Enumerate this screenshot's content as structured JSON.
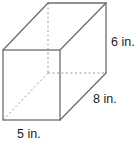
{
  "figure": {
    "type": "rectangular-prism",
    "labels": {
      "height": "6 in.",
      "depth": "8 in.",
      "width": "5 in."
    },
    "colors": {
      "edge": "#6e6e6e",
      "hidden_edge": "#9a9a9a",
      "text": "#1a1a1a",
      "background": "#ffffff"
    }
  }
}
